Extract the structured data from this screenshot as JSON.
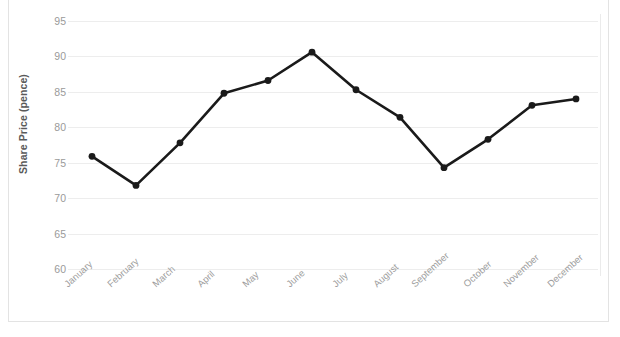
{
  "chart_data": {
    "type": "line",
    "title": "",
    "xlabel": "",
    "ylabel": "Share Price (pence)",
    "categories": [
      "January",
      "February",
      "March",
      "April",
      "May",
      "June",
      "July",
      "August",
      "September",
      "October",
      "November",
      "December"
    ],
    "values": [
      75.9,
      71.8,
      77.8,
      84.8,
      86.6,
      90.6,
      85.3,
      81.4,
      74.3,
      78.3,
      83.1,
      84.0
    ],
    "ylim": [
      60,
      95
    ],
    "yticks": [
      95,
      90,
      85,
      80,
      75,
      70,
      65,
      60
    ],
    "ytick_labels": [
      "95",
      "90",
      "85",
      "80",
      "75",
      "70",
      "65",
      "60"
    ],
    "grid": true,
    "legend": "none",
    "series": [
      {
        "name": "Share Price",
        "color": "#1a1a1a",
        "marker": "circle",
        "values": [
          75.9,
          71.8,
          77.8,
          84.8,
          86.6,
          90.6,
          85.3,
          81.4,
          74.3,
          78.3,
          83.1,
          84.0
        ]
      }
    ]
  },
  "axes": {
    "y_title": "Share Price (pence)",
    "y_tick_0": "95",
    "y_tick_1": "90",
    "y_tick_2": "85",
    "y_tick_3": "80",
    "y_tick_4": "75",
    "y_tick_5": "70",
    "y_tick_6": "65",
    "y_tick_7": "60"
  },
  "x_labels": {
    "m0": "January",
    "m1": "February",
    "m2": "March",
    "m3": "April",
    "m4": "May",
    "m5": "June",
    "m6": "July",
    "m7": "August",
    "m8": "September",
    "m9": "October",
    "m10": "November",
    "m11": "December"
  },
  "colors": {
    "line": "#1a1a1a",
    "marker": "#171717",
    "gridline": "#ededed",
    "tick_text": "#9a9a9a",
    "axis_title_text": "#5a5a5a",
    "background": "#ffffff",
    "frame_border": "#e3e3e3"
  }
}
